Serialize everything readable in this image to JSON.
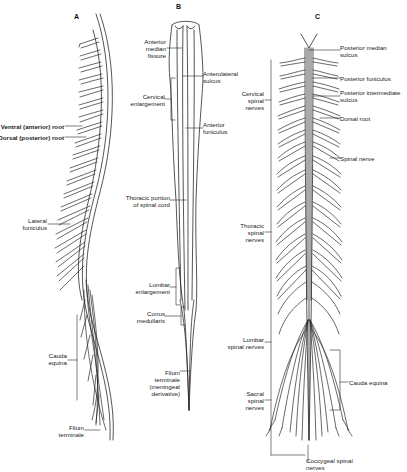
{
  "figure": {
    "panels": [
      {
        "id": "A",
        "label": "A",
        "annotations": [
          {
            "key": "ventral_root",
            "text": "Ventral (anterior) root"
          },
          {
            "key": "dorsal_root",
            "text": "Dorsal (posterior) root"
          },
          {
            "key": "lateral_funiculus",
            "text": "Lateral\nfuniculus"
          },
          {
            "key": "cauda_equina",
            "text": "Cauda\nequina"
          },
          {
            "key": "filum_terminale",
            "text": "Filum\nterminale"
          }
        ]
      },
      {
        "id": "B",
        "label": "B",
        "annotations": [
          {
            "key": "anterior_median_fissure",
            "text": "Anterior\nmedian\nfissure"
          },
          {
            "key": "anterolateral_sulcus",
            "text": "Anterolateral\nsulcus"
          },
          {
            "key": "cervical_enlargement",
            "text": "Cervical\nenlargement"
          },
          {
            "key": "anterior_funiculus",
            "text": "Anterior\nfuniculus"
          },
          {
            "key": "thoracic_portion",
            "text": "Thoracic portion\nof spinal cord"
          },
          {
            "key": "lumbar_enlargement",
            "text": "Lumbar\nenlargement"
          },
          {
            "key": "conus_medullaris",
            "text": "Conus\nmedullaris"
          },
          {
            "key": "filum_terminale_meningeal",
            "text": "Filum\nterminale\n(meningeal\nderivative)"
          }
        ]
      },
      {
        "id": "C",
        "label": "C",
        "annotations": [
          {
            "key": "posterior_median_sulcus",
            "text": "Posterior median\nsulcus"
          },
          {
            "key": "posterior_funiculus",
            "text": "Posterior funiculus"
          },
          {
            "key": "posterior_intermediate_sulcus",
            "text": "Posterior intermediate\nsulcus"
          },
          {
            "key": "dorsal_root",
            "text": "Dorsal root"
          },
          {
            "key": "spinal_nerve",
            "text": "Spinal nerve"
          },
          {
            "key": "cervical_spinal_nerves",
            "text": "Cervical\nspinal\nnerves"
          },
          {
            "key": "thoracic_spinal_nerves",
            "text": "Thoracic\nspinal\nnerves"
          },
          {
            "key": "lumbar_spinal_nerves",
            "text": "Lumbar\nspinal nerves"
          },
          {
            "key": "sacral_spinal_nerves",
            "text": "Sacral\nspinal\nnerves"
          },
          {
            "key": "cauda_equina",
            "text": "Cauda equina"
          },
          {
            "key": "coccygeal_spinal_nerves",
            "text": "Coccygeal spinal\nnerves"
          }
        ]
      }
    ]
  },
  "colors": {
    "ink": "#222222",
    "background": "#ffffff"
  }
}
